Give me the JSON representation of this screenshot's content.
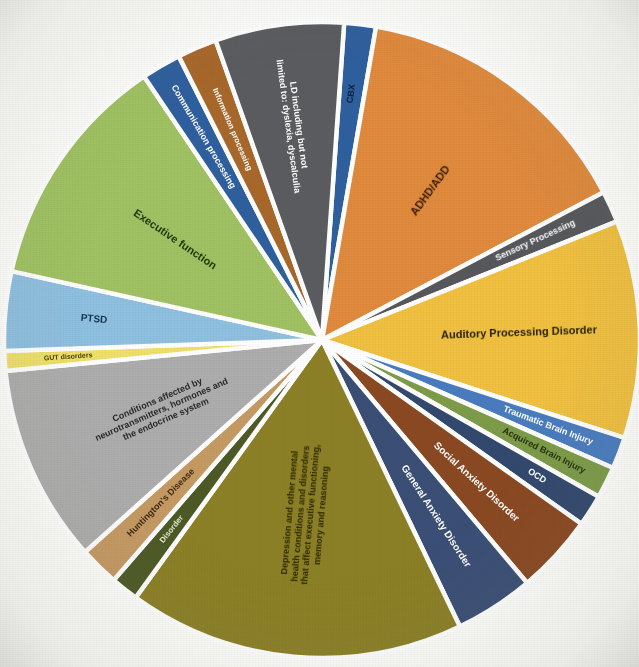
{
  "chart_data": {
    "type": "pie",
    "title": "",
    "subtitle": "",
    "xlabel": "",
    "ylabel": "",
    "legend_position": "none",
    "grid": false,
    "units": "percent",
    "center": {
      "x": 322,
      "y": 340
    },
    "radius": 318,
    "start_angle_deg": -86,
    "labels": [
      "CBX",
      "ADHD/ADD",
      "Sensory Processing",
      "Auditory Processing Disorder",
      "Traumatic Brain Injury",
      "Acquired Brain Injury",
      "OCD",
      "Social Anxiety Disorder",
      "General Anxiety Disorder",
      "Depression and other mental health conditions and disorders that affect executive functioning, memory and reasoning",
      "Disorder",
      "Huntington's Disease",
      "Conditions affected by neurotransmitters, hormones and the endocrine system",
      "GUT disorders",
      "PTSD",
      "Executive function",
      "Communication processing",
      "Information processing",
      "LD including but not limited to: dyslexia, dyscalculia"
    ],
    "values": [
      1.6,
      14.5,
      1.6,
      11.0,
      1.6,
      1.6,
      1.6,
      4.0,
      4.0,
      17.0,
      1.4,
      2.0,
      10.0,
      1.0,
      4.0,
      12.0,
      2.0,
      2.0,
      6.5
    ],
    "colors": [
      "#2f5f9e",
      "#e08a3c",
      "#57595b",
      "#f0c041",
      "#4a7cbf",
      "#7d9c4a",
      "#32486e",
      "#8a4a22",
      "#3b4f76",
      "#8c8026",
      "#4e5a25",
      "#c59a63",
      "#adadad",
      "#efe06a",
      "#8fc0e0",
      "#a0c262",
      "#2f5f9e",
      "#a8682c",
      "#5a5c5e"
    ],
    "label_colors": [
      "#12233c",
      "#3a1d08",
      "#ffffff",
      "#2a2207",
      "#ffffff",
      "#24310f",
      "#ffffff",
      "#ffffff",
      "#ffffff",
      "#2d2808",
      "#dfe8c8",
      "#3d2a10",
      "#2b2b2b",
      "#4a440c",
      "#13364d",
      "#213a0c",
      "#ffffff",
      "#ffffff",
      "#ffffff"
    ],
    "label_radius_frac": [
      0.78,
      0.58,
      0.74,
      0.62,
      0.76,
      0.78,
      0.8,
      0.66,
      0.66,
      0.55,
      0.76,
      0.72,
      0.55,
      0.8,
      0.72,
      0.56,
      0.74,
      0.72,
      0.68
    ],
    "label_font_px": [
      9,
      11,
      9,
      11,
      9,
      9,
      9,
      10,
      10,
      9,
      8,
      9,
      9,
      7,
      10,
      11,
      9,
      8,
      9
    ],
    "label_lines": [
      [
        "CBX"
      ],
      [
        "ADHD/ADD"
      ],
      [
        "Sensory Processing"
      ],
      [
        "Auditory Processing Disorder"
      ],
      [
        "Traumatic Brain Injury"
      ],
      [
        "Acquired Brain Injury"
      ],
      [
        "OCD"
      ],
      [
        "Social Anxiety Disorder"
      ],
      [
        "General Anxiety Disorder"
      ],
      [
        "Depression and other mental",
        "health conditions and disorders",
        "that affect executive functioning,",
        "memory and reasoning"
      ],
      [
        "Disorder"
      ],
      [
        "Huntington's Disease"
      ],
      [
        "Conditions affected by",
        "neurotransmitters, hormones and",
        "the endocrine system"
      ],
      [
        "GUT disorders"
      ],
      [
        "PTSD"
      ],
      [
        "Executive function"
      ],
      [
        "Communication processing"
      ],
      [
        "Information processing"
      ],
      [
        "LD including but not",
        "limited to: dyslexia, dyscalculia"
      ]
    ]
  },
  "figure": {
    "background_color": "#fdfdfb",
    "slice_border_color": "#ffffff"
  }
}
